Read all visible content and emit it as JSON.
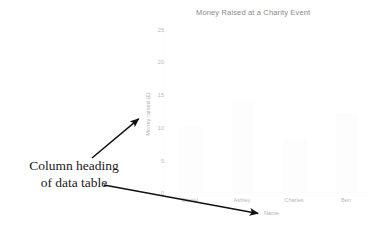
{
  "chart_data": {
    "type": "bar",
    "title": "Money Raised at a Charity Event",
    "xlabel": "Name",
    "ylabel": "Money raised (£)",
    "categories": [
      "Daniel",
      "Ashley",
      "Charles",
      "Ben"
    ],
    "values": [
      0,
      0,
      0,
      0
    ],
    "ylim": [
      0,
      25
    ],
    "ytick_labels": [
      "25",
      "20",
      "15",
      "10",
      "5",
      "0"
    ],
    "ytick_values": [
      25,
      20,
      15,
      10,
      5,
      0
    ],
    "grid": false,
    "legend": "none",
    "axis_color": "#b9b9b9",
    "title_color": "#8a8a8a"
  },
  "annotation": {
    "lines": [
      "Column heading",
      "of data table"
    ],
    "color": "#1a1a1a",
    "arrows": [
      {
        "name": "arrow-to-y-axis-label",
        "x1": 92,
        "y1": 158,
        "x2": 141,
        "y2": 117
      },
      {
        "name": "arrow-to-x-axis-label",
        "x1": 104,
        "y1": 185,
        "x2": 261,
        "y2": 214
      }
    ]
  }
}
